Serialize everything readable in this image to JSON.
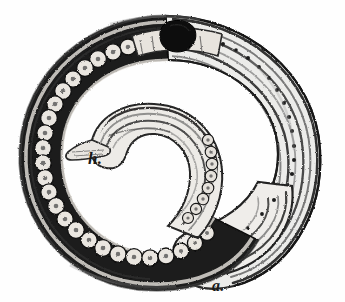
{
  "plate": {
    "kind": "scientific-engraving",
    "subject": "coiled nematode worm larva",
    "technique": "hatched line engraving, monochrome",
    "background_color": "#fefefe",
    "ink_color": "#1a1a1a",
    "midtone_color": "#6b6b6b",
    "highlight_color": "#f2f0ec",
    "width_px": 345,
    "height_px": 302
  },
  "labels": [
    {
      "id": "h",
      "text": "h.",
      "x": 88,
      "y": 150,
      "style": "italic-serif",
      "points_to": "inner-coil-head-tip"
    },
    {
      "id": "a",
      "text": "a.",
      "x": 212,
      "y": 278,
      "style": "italic-serif",
      "points_to": "outer-coil-tail-tip"
    }
  ],
  "anatomy": {
    "outer_spiral": {
      "name": "outer body whorl",
      "description": "broad spiral band sweeping from upper-left around the right side down to a blunt rounded tail at lower right",
      "texture": "parallel longitudinal striations with a row of dark granules"
    },
    "inner_spiral": {
      "name": "inner body whorl",
      "description": "narrower coil terminating in a tapered pointed head tip directed to the left, beside label h."
    },
    "granule_chain": {
      "name": "chain of rounded cells / eggs",
      "description": "row of light circular corpuscles set in a dark band along the left and lower outer margin of the coil",
      "approx_count": 34
    },
    "dark_organ": {
      "name": "dark organ mass",
      "description": "solid black irregular blob near the top of the coil",
      "x": 168,
      "y": 32,
      "width": 28,
      "height": 20
    },
    "granule_row": {
      "name": "row of dark granules",
      "description": "single file of small dark dots running along the inner edge of the right-hand band",
      "approx_count": 22
    }
  }
}
